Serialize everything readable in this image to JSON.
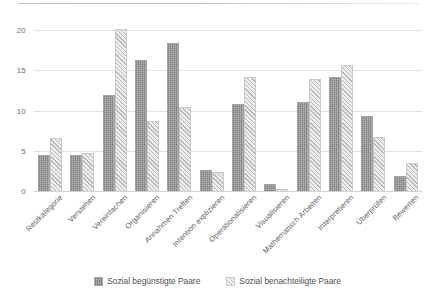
{
  "chart_data": {
    "type": "bar",
    "title": "",
    "subtitle": "",
    "xlabel": "",
    "ylabel": "",
    "ylim": [
      0,
      20
    ],
    "yticks": [
      0,
      5,
      10,
      15,
      20
    ],
    "grid": true,
    "legend_position": "bottom",
    "categories": [
      "Restkategorie",
      "Verstehen",
      "Vereinfachen",
      "Organisieren",
      "Annahmen Treffen",
      "Intention explizieren",
      "Operationalisieren",
      "Visualisieren",
      "Mathematisch Arbeiten",
      "Interpretieren",
      "Überprüfen",
      "Bewerten"
    ],
    "series": [
      {
        "name": "Sozial begünstigte Paare",
        "color": "#b2b2b2",
        "pattern": "cross-hatch",
        "values": [
          4.4,
          4.4,
          11.8,
          16.1,
          18.3,
          2.5,
          10.7,
          0.8,
          10.9,
          14.0,
          9.2,
          1.7
        ]
      },
      {
        "name": "Sozial benachteiligte Paare",
        "color": "#ededed",
        "pattern": "diagonal-hatch",
        "values": [
          6.4,
          4.6,
          20.0,
          8.6,
          10.3,
          2.2,
          14.0,
          0.1,
          13.8,
          15.5,
          6.6,
          3.4
        ]
      }
    ]
  },
  "legend": {
    "items": [
      {
        "label": "Sozial begünstigte Paare"
      },
      {
        "label": "Sozial benachteiligte Paare"
      }
    ]
  }
}
